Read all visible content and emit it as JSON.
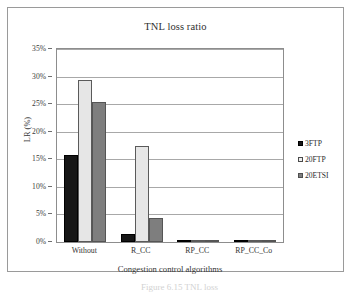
{
  "figure": {
    "caption": "Figure 6.15   TNL loss"
  },
  "chart_data": {
    "type": "bar",
    "title": "TNL loss ratio",
    "xlabel": "Congestion control algorithms",
    "ylabel": "LR (%)",
    "categories": [
      "Without",
      "R_CC",
      "RP_CC",
      "RP_CC_Co"
    ],
    "series": [
      {
        "name": "3FTP",
        "color": "#161616",
        "values": [
          15.7,
          1.4,
          0.15,
          0.1
        ]
      },
      {
        "name": "20FTP",
        "color": "#e6e6e6",
        "values": [
          29.3,
          17.4,
          0.05,
          0.05
        ]
      },
      {
        "name": "20ETSI",
        "color": "#7e7e7e",
        "values": [
          25.4,
          4.4,
          0.25,
          0.25
        ]
      }
    ],
    "ylim": [
      0,
      35
    ],
    "ytick_values": [
      0,
      5,
      10,
      15,
      20,
      25,
      30,
      35
    ],
    "ytick_labels": [
      "0%",
      "5%",
      "10%",
      "15%",
      "20%",
      "25%",
      "30%",
      "35%"
    ],
    "grid": "horizontal",
    "legend_position": "right"
  }
}
